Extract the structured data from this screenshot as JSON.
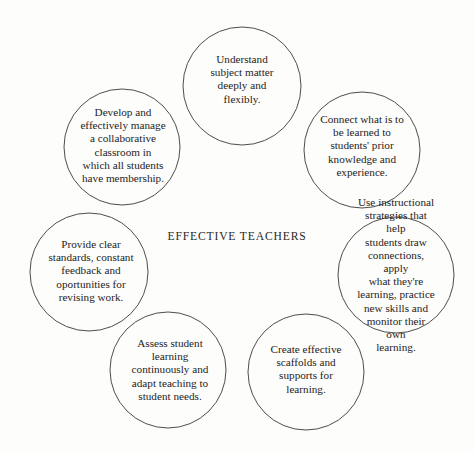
{
  "diagram": {
    "title": "EFFECTIVE TEACHERS",
    "center": {
      "label": "EFFECTIVE TEACHERS",
      "x": 237,
      "y": 236
    },
    "style": {
      "background_color": "#fdfdfc",
      "stroke_color": "#3a3937",
      "text_color": "#1d1c1b",
      "stroke_width": 0.9,
      "fill": "none"
    },
    "nodes": [
      {
        "id": "understand-subject-matter",
        "label": "Understand\nsubject matter\ndeeply and\nflexibly.",
        "cx": 242,
        "cy": 86,
        "r": 59,
        "text_x": 242,
        "text_y": 79
      },
      {
        "id": "connect-prior-knowledge",
        "label": "Connect what is to\nbe learned to\nstudents' prior\nknowledge and\nexperience.",
        "cx": 362,
        "cy": 150,
        "r": 58,
        "text_x": 362,
        "text_y": 146
      },
      {
        "id": "use-instructional-strategies",
        "label": "Use instructional\nstrategies that help\nstudents draw\nconnections, apply\nwhat they're\nlearning, practice\nnew skills and\nmonitor their own\nlearning.",
        "cx": 396,
        "cy": 275,
        "r": 58,
        "text_x": 396,
        "text_y": 275
      },
      {
        "id": "create-scaffolds-supports",
        "label": "Create effective\nscaffolds and\nsupports for\nlearning.",
        "cx": 306,
        "cy": 372,
        "r": 58,
        "text_x": 306,
        "text_y": 369
      },
      {
        "id": "assess-student-learning",
        "label": "Assess student\nlearning\ncontinuously and\nadapt teaching to\nstudent needs.",
        "cx": 168,
        "cy": 370,
        "r": 58,
        "text_x": 170,
        "text_y": 370
      },
      {
        "id": "provide-clear-standards",
        "label": "Provide clear\nstandards, constant\nfeedback and\noportunities for\nrevising work.",
        "cx": 89,
        "cy": 272,
        "r": 59,
        "text_x": 91,
        "text_y": 271
      },
      {
        "id": "manage-collaborative-classroom",
        "label": "Develop and\neffectively manage\na collaborative\nclassroom in\nwhich all students\nhave membership.",
        "cx": 122,
        "cy": 147,
        "r": 58,
        "text_x": 123,
        "text_y": 146
      }
    ]
  }
}
